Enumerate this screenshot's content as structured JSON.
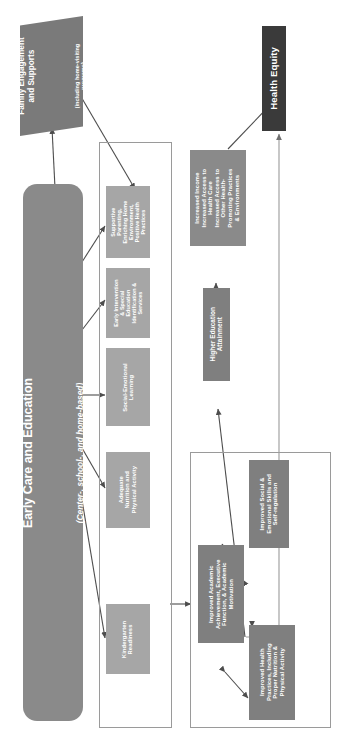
{
  "figure": {
    "orientation": "rotated-90",
    "colors": {
      "primary_box": "#8a8a8a",
      "secondary_box": "#a6a6a6",
      "outcome_box": "#7f7f7f",
      "terminal_box": "#3a3a3a",
      "connector": "#4d4d4d",
      "group_outline": "#9a9a9a",
      "text_on_box": "#ffffff",
      "background": "#ffffff"
    }
  },
  "nodes": {
    "family_engagement": {
      "label": "Family Engagement\nand Supports",
      "sublabel": "(including home-visiting\nprograms)",
      "shape": "parallelogram",
      "color": "#7a7a7a"
    },
    "health_equity": {
      "label": "Health Equity",
      "shape": "rectangle",
      "color": "#3a3a3a"
    },
    "early_care_education": {
      "label": "Early Care and Education",
      "sublabel": "(Center-, school-, and home-based)",
      "shape": "rounded-rectangle",
      "color": "#8a8a8a"
    },
    "higher_education_attainment": {
      "label": "Higher Education\nAttainment",
      "shape": "rectangle",
      "color": "#7f7f7f"
    },
    "increased_income_access": {
      "label": "Increased Income\nIncreased Access to\nHealth Care\nIncreased Access to\nOther Health-\nPromoting Practices\n& Environments",
      "shape": "rectangle",
      "color": "#8a8a8a"
    }
  },
  "mechanisms": {
    "group_name": "early-care-mechanisms",
    "items": [
      {
        "label": "Supportive\nParenting,\nEnriching Home\nEnvironment,\nPositive Health\nPractices"
      },
      {
        "label": "Early Intervention\n& Special\nEducation\nIdentification &\nServices"
      },
      {
        "label": "Social-Emotional\nLearning"
      },
      {
        "label": "Adequate\nNutrition and\nPhysical Activity"
      },
      {
        "label": "Kindergarten\nReadiness"
      }
    ]
  },
  "outcomes": {
    "group_name": "child-outcomes",
    "items": [
      {
        "label": "Improved Academic\nAchievement, Executive\nFunction, & Academic\nMotivation"
      },
      {
        "label": "Improved Social &\nEmotional Skills and\nSelf-regulation"
      },
      {
        "label": "Improved Health\nPractices, Including\nProper Nutrition &\nPhysical Activity"
      }
    ]
  },
  "connections": [
    {
      "from": "early_care_education",
      "to": "family_engagement",
      "style": "solid-arrow"
    },
    {
      "from": "family_engagement",
      "to": "mechanism_supportive_parenting",
      "style": "solid-arrow"
    },
    {
      "from": "early_care_education",
      "to": "mechanism_supportive_parenting",
      "style": "solid-arrow"
    },
    {
      "from": "early_care_education",
      "to": "mechanism_early_intervention",
      "style": "solid-arrow"
    },
    {
      "from": "early_care_education",
      "to": "mechanism_social_emotional",
      "style": "solid-arrow"
    },
    {
      "from": "early_care_education",
      "to": "mechanism_nutrition",
      "style": "solid-arrow"
    },
    {
      "from": "early_care_education",
      "to": "mechanism_kindergarten",
      "style": "solid-arrow"
    },
    {
      "from": "mechanisms_group",
      "to": "outcomes_group",
      "style": "solid-arrow"
    },
    {
      "from": "outcomes_group",
      "to": "higher_education_attainment",
      "style": "solid-arrow"
    },
    {
      "from": "outcomes_group",
      "to": "health_equity",
      "style": "solid-arrow"
    },
    {
      "from": "higher_education_attainment",
      "to": "increased_income_access",
      "style": "solid-arrow"
    },
    {
      "from": "increased_income_access",
      "to": "health_equity",
      "style": "solid-arrow"
    },
    {
      "from": "improved_academic",
      "to": "improved_social_emotional",
      "style": "double-arrow"
    },
    {
      "from": "improved_social_emotional",
      "to": "improved_health",
      "style": "double-arrow"
    },
    {
      "from": "improved_academic",
      "to": "improved_health",
      "style": "double-arrow"
    }
  ]
}
